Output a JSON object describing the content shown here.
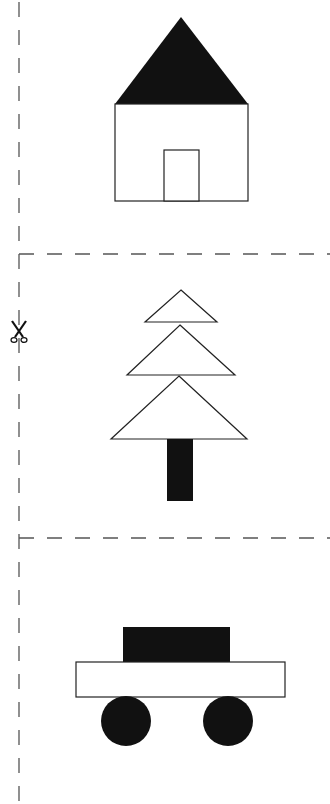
{
  "worksheet": {
    "title": "Cut-out shapes worksheet",
    "cut_guides": {
      "vertical_line_x": 19,
      "horizontal_lines_y": [
        254,
        538
      ],
      "line_color": "#555555"
    },
    "scissors_icon": {
      "name": "scissors-icon",
      "x": 19,
      "y": 333
    },
    "panels": [
      {
        "name": "house",
        "shapes": [
          {
            "type": "triangle",
            "role": "roof",
            "fill": "#111111"
          },
          {
            "type": "rectangle",
            "role": "wall",
            "fill": "#ffffff"
          },
          {
            "type": "rectangle",
            "role": "door",
            "fill": "#ffffff"
          }
        ]
      },
      {
        "name": "tree",
        "shapes": [
          {
            "type": "triangle",
            "role": "top-tier",
            "fill": "#ffffff"
          },
          {
            "type": "triangle",
            "role": "middle-tier",
            "fill": "#ffffff"
          },
          {
            "type": "triangle",
            "role": "bottom-tier",
            "fill": "#ffffff"
          },
          {
            "type": "rectangle",
            "role": "trunk",
            "fill": "#111111"
          }
        ]
      },
      {
        "name": "car",
        "shapes": [
          {
            "type": "rectangle",
            "role": "cabin",
            "fill": "#111111"
          },
          {
            "type": "rectangle",
            "role": "body",
            "fill": "#ffffff"
          },
          {
            "type": "circle",
            "role": "front-wheel",
            "fill": "#111111"
          },
          {
            "type": "circle",
            "role": "rear-wheel",
            "fill": "#111111"
          }
        ]
      }
    ]
  }
}
